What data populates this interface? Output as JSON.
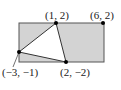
{
  "diagram": {
    "title": "",
    "rectangle": {
      "x1": -3,
      "y1": -2,
      "x2": 6,
      "y2": 2,
      "fill": "#d3d3d3",
      "stroke": "#555555"
    },
    "triangle": {
      "vertices": [
        "(-3, -1)",
        "(1, 2)",
        "(2, -2)"
      ],
      "fill": "#ffffff",
      "stroke": "#333333"
    },
    "points": [
      {
        "label": "(1, 2)",
        "x": 1,
        "y": 2
      },
      {
        "label": "(6, 2)",
        "x": 6,
        "y": 2
      },
      {
        "label": "(-3, -1)",
        "x": -3,
        "y": -1
      },
      {
        "label": "(2, -2)",
        "x": 2,
        "y": -2
      }
    ]
  }
}
